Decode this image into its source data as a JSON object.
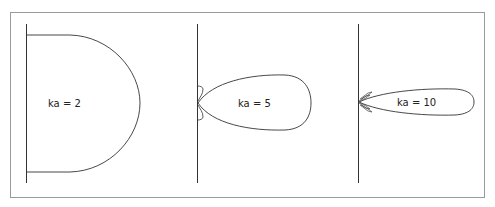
{
  "figure": {
    "frame_color": "#9a9a9a",
    "line_color": "#333333",
    "panels": [
      {
        "id": "ka2",
        "label": "ka = 2",
        "ka": 2,
        "shape": "broad hemispherical lobe"
      },
      {
        "id": "ka5",
        "label": "ka = 5",
        "ka": 5,
        "shape": "narrower main lobe with small side lobes"
      },
      {
        "id": "ka10",
        "label": "ka = 10",
        "ka": 10,
        "shape": "narrow main lobe with multiple tiny side lobes"
      }
    ]
  }
}
